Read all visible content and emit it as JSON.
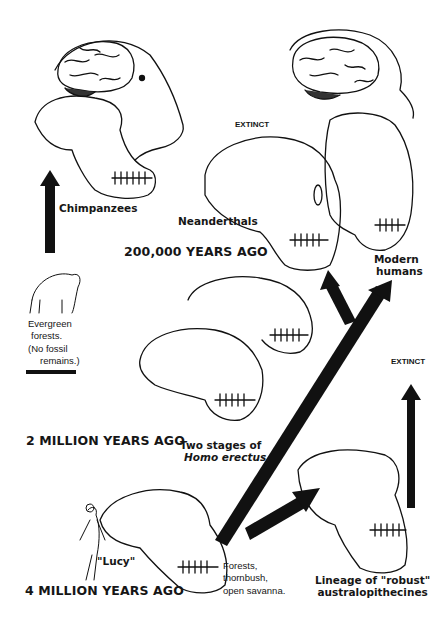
{
  "eras": [
    {
      "label": "200,000 YEARS AGO"
    },
    {
      "label": "2 MILLION YEARS AGO"
    },
    {
      "label": "4 MILLION YEARS AGO"
    }
  ],
  "species": {
    "chimpanzees": {
      "label": "Chimpanzees",
      "habitat": [
        "Evergreen",
        "forests.",
        "(No fossil",
        "remains.)"
      ]
    },
    "neanderthals": {
      "label": "Neanderthals",
      "status": "EXTINCT"
    },
    "modern_humans": {
      "label_line1": "Modern",
      "label_line2": "humans"
    },
    "homo_erectus": {
      "label_line1": "Two stages of",
      "label_line2": "Homo erectus."
    },
    "lucy": {
      "label": "\"Lucy\"",
      "habitat": [
        "Forests,",
        "thornbush,",
        "open savanna."
      ]
    },
    "robust": {
      "label_line1": "Lineage of \"robust\"",
      "label_line2": "australopithecines",
      "status": "EXTINCT"
    }
  }
}
